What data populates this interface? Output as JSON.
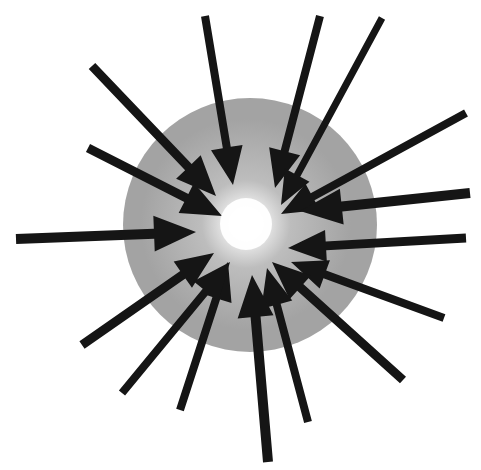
{
  "figure": {
    "canvas": {
      "width": 481,
      "height": 470,
      "background": "#ffffff"
    },
    "sphere": {
      "label": "grey sphere",
      "center_x": 250,
      "center_y": 225,
      "radius": 127,
      "fill_outer": "#a3a3a3",
      "fill_mid": "#bdbdbd",
      "fill_core": "#ffffff",
      "gradient_center_x": 246,
      "gradient_center_y": 224,
      "core_stop_pct": 6,
      "mid_stop_pct": 26,
      "outer_stop_pct": 62
    },
    "focal_point": {
      "label": "convergence focus",
      "x": 246,
      "y": 224,
      "highlight_color": "#ffffff"
    },
    "arrow_style": {
      "color": "#151515",
      "shaft_width": 8,
      "head_length": 36,
      "head_half_width": 16,
      "tip_gap": 18
    },
    "arrow_count": 16,
    "arrows": [
      {
        "name": "arrow-n-left",
        "angle_deg": 255,
        "tail_x": 205,
        "tail_y": 16,
        "tip_x": 233,
        "tip_y": 185,
        "shaft_width": 8,
        "head_length": 38,
        "head_half_width": 16
      },
      {
        "name": "arrow-n-right",
        "angle_deg": 285,
        "tail_x": 320,
        "tail_y": 16,
        "tip_x": 275,
        "tip_y": 188,
        "shaft_width": 8,
        "head_length": 38,
        "head_half_width": 16
      },
      {
        "name": "arrow-nne",
        "angle_deg": 292,
        "tail_x": 382,
        "tail_y": 18,
        "tip_x": 281,
        "tip_y": 205,
        "shaft_width": 7,
        "head_length": 34,
        "head_half_width": 14
      },
      {
        "name": "arrow-nw-outer",
        "angle_deg": 315,
        "tail_x": 92,
        "tail_y": 66,
        "tip_x": 216,
        "tip_y": 196,
        "shaft_width": 9,
        "head_length": 40,
        "head_half_width": 17
      },
      {
        "name": "arrow-wnw-upper",
        "angle_deg": 337,
        "tail_x": 88,
        "tail_y": 148,
        "tip_x": 222,
        "tip_y": 216,
        "shaft_width": 9,
        "head_length": 40,
        "head_half_width": 17
      },
      {
        "name": "arrow-ene",
        "angle_deg": 215,
        "tail_x": 466,
        "tail_y": 113,
        "tip_x": 281,
        "tip_y": 214,
        "shaft_width": 8,
        "head_length": 36,
        "head_half_width": 15
      },
      {
        "name": "arrow-e-horizontal",
        "angle_deg": 185,
        "tail_x": 470,
        "tail_y": 193,
        "tip_x": 300,
        "tip_y": 211,
        "shaft_width": 10,
        "head_length": 42,
        "head_half_width": 18
      },
      {
        "name": "arrow-w-horizontal",
        "angle_deg": 5,
        "tail_x": 16,
        "tail_y": 239,
        "tip_x": 196,
        "tip_y": 232,
        "shaft_width": 10,
        "head_length": 42,
        "head_half_width": 18
      },
      {
        "name": "arrow-ese-upper",
        "angle_deg": 172,
        "tail_x": 466,
        "tail_y": 238,
        "tip_x": 288,
        "tip_y": 248,
        "shaft_width": 9,
        "head_length": 38,
        "head_half_width": 16
      },
      {
        "name": "arrow-ese-lower",
        "angle_deg": 158,
        "tail_x": 444,
        "tail_y": 318,
        "tip_x": 291,
        "tip_y": 262,
        "shaft_width": 8,
        "head_length": 36,
        "head_half_width": 15
      },
      {
        "name": "arrow-se",
        "angle_deg": 143,
        "tail_x": 403,
        "tail_y": 380,
        "tip_x": 272,
        "tip_y": 262,
        "shaft_width": 9,
        "head_length": 38,
        "head_half_width": 16
      },
      {
        "name": "arrow-sse",
        "angle_deg": 118,
        "tail_x": 308,
        "tail_y": 422,
        "tip_x": 267,
        "tip_y": 268,
        "shaft_width": 8,
        "head_length": 38,
        "head_half_width": 16
      },
      {
        "name": "arrow-s",
        "angle_deg": 97,
        "tail_x": 268,
        "tail_y": 462,
        "tip_x": 252,
        "tip_y": 275,
        "shaft_width": 10,
        "head_length": 42,
        "head_half_width": 18
      },
      {
        "name": "arrow-ssw",
        "angle_deg": 70,
        "tail_x": 180,
        "tail_y": 410,
        "tip_x": 228,
        "tip_y": 262,
        "shaft_width": 8,
        "head_length": 38,
        "head_half_width": 16
      },
      {
        "name": "arrow-sw",
        "angle_deg": 43,
        "tail_x": 82,
        "tail_y": 345,
        "tip_x": 214,
        "tip_y": 253,
        "shaft_width": 9,
        "head_length": 38,
        "head_half_width": 16
      },
      {
        "name": "arrow-wsw",
        "angle_deg": 22,
        "tail_x": 122,
        "tail_y": 393,
        "tip_x": 230,
        "tip_y": 262,
        "shaft_width": 8,
        "head_length": 38,
        "head_half_width": 16
      }
    ]
  }
}
